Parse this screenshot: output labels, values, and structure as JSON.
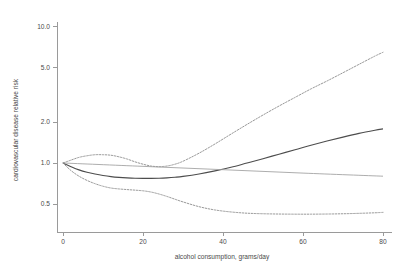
{
  "chart_data": {
    "type": "line",
    "title": "",
    "subtitle": "",
    "xlabel": "alcohol consumption, grams/day",
    "ylabel": "cardiovascular disease relative risk",
    "xlim": [
      0,
      84
    ],
    "ylim": [
      0.4,
      11.5
    ],
    "yscale": "log",
    "xscale": "linear",
    "grid": false,
    "legend": "none",
    "xticks": [
      0,
      20,
      40,
      60,
      80
    ],
    "xtick_labels": [
      "0",
      "20",
      "40",
      "60",
      "80"
    ],
    "yticks": [
      0.5,
      1.0,
      2.0,
      5.0,
      10.0
    ],
    "ytick_labels": [
      "0.5",
      "1.0",
      "2.0",
      "5.0",
      "10.0"
    ],
    "series": [
      {
        "name": "upper confidence limit",
        "style": "dashed",
        "color": "#8c8c8c",
        "x": [
          0,
          2,
          4,
          6,
          8,
          10,
          12,
          14,
          16,
          18,
          20,
          22,
          24,
          26,
          28,
          30,
          34,
          38,
          42,
          46,
          50,
          54,
          58,
          62,
          66,
          70,
          74,
          78,
          80
        ],
        "y": [
          1.0,
          1.05,
          1.1,
          1.13,
          1.15,
          1.15,
          1.14,
          1.11,
          1.07,
          1.02,
          0.98,
          0.95,
          0.94,
          0.95,
          0.98,
          1.03,
          1.18,
          1.38,
          1.63,
          1.92,
          2.25,
          2.62,
          3.03,
          3.5,
          4.0,
          4.6,
          5.3,
          6.1,
          6.5
        ]
      },
      {
        "name": "central estimate",
        "style": "solid-bold",
        "color": "#4d4d4d",
        "x": [
          0,
          2,
          4,
          6,
          8,
          10,
          12,
          14,
          16,
          18,
          20,
          22,
          24,
          26,
          28,
          30,
          34,
          38,
          42,
          46,
          50,
          54,
          58,
          62,
          66,
          70,
          74,
          78,
          80
        ],
        "y": [
          1.0,
          0.94,
          0.89,
          0.855,
          0.83,
          0.81,
          0.795,
          0.785,
          0.778,
          0.773,
          0.771,
          0.771,
          0.773,
          0.778,
          0.786,
          0.797,
          0.83,
          0.875,
          0.93,
          1.0,
          1.075,
          1.16,
          1.25,
          1.35,
          1.45,
          1.55,
          1.65,
          1.74,
          1.78
        ]
      },
      {
        "name": "linear trend",
        "style": "solid-thin",
        "color": "#9e9e9e",
        "x": [
          0,
          20,
          40,
          60,
          80
        ],
        "y": [
          1.0,
          0.945,
          0.893,
          0.843,
          0.8
        ]
      },
      {
        "name": "lower confidence limit",
        "style": "dashed",
        "color": "#8c8c8c",
        "x": [
          0,
          2,
          4,
          6,
          8,
          10,
          12,
          14,
          16,
          18,
          20,
          22,
          24,
          26,
          28,
          30,
          34,
          38,
          42,
          46,
          50,
          54,
          58,
          62,
          66,
          70,
          74,
          78,
          80
        ],
        "y": [
          1.0,
          0.88,
          0.8,
          0.745,
          0.705,
          0.675,
          0.655,
          0.645,
          0.638,
          0.632,
          0.625,
          0.612,
          0.592,
          0.568,
          0.542,
          0.518,
          0.478,
          0.452,
          0.437,
          0.428,
          0.424,
          0.422,
          0.421,
          0.421,
          0.422,
          0.424,
          0.427,
          0.431,
          0.434
        ]
      }
    ],
    "colors": {
      "axis": "#9a9a9a",
      "text": "#4a4a4a",
      "central": "#4d4d4d",
      "confidence": "#8c8c8c",
      "trend": "#9e9e9e",
      "background": "#ffffff"
    }
  }
}
